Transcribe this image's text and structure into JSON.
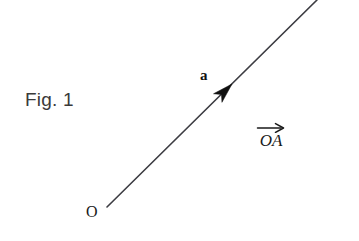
{
  "figure": {
    "caption": "Fig. 1",
    "background_color": "#ffffff",
    "width": 359,
    "height": 241
  },
  "labels": {
    "vector_name": "a",
    "origin_point": "O",
    "vector_notation": "OA",
    "vector_notation_accent": "rightward-arrow-accent"
  },
  "colors": {
    "line": "#3c3c42",
    "arrowhead": "#101010",
    "caption_text": "#3a3a3a",
    "math_text": "#1a1a1a"
  },
  "chart_data": {
    "type": "scatter",
    "title": "Fig. 1",
    "xlabel": "",
    "ylabel": "",
    "xlim": [
      0,
      359
    ],
    "ylim": [
      241,
      0
    ],
    "grid": false,
    "legend": "none",
    "annotations": [
      {
        "name": "ray-OA",
        "kind": "line",
        "from": [
          107,
          207
        ],
        "to": [
          317,
          0
        ],
        "slope": -0.986,
        "angle_degrees": 44.6,
        "stroke_width": 1.6,
        "color": "#3c3c42"
      },
      {
        "name": "arrowhead-a",
        "kind": "arrowhead",
        "tip": [
          232,
          84
        ],
        "direction_degrees": 44.6,
        "length": 20,
        "half_width": 6,
        "color": "#101010"
      },
      {
        "name": "label-a",
        "kind": "text",
        "text": "a",
        "position": [
          203,
          78
        ],
        "style": "bold-serif"
      },
      {
        "name": "label-O",
        "kind": "text",
        "text": "O",
        "position": [
          92,
          217
        ],
        "style": "serif"
      },
      {
        "name": "label-OA",
        "kind": "text",
        "text": "OA",
        "position": [
          271,
          147
        ],
        "style": "italic-serif-with-vector-arrow"
      },
      {
        "name": "caption",
        "kind": "text",
        "text": "Fig. 1",
        "position": [
          25,
          107
        ],
        "style": "sans-serif"
      }
    ]
  }
}
